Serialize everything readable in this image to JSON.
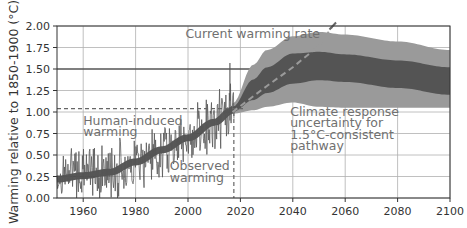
{
  "chart_data": {
    "type": "line",
    "title": "",
    "xlabel": "",
    "ylabel": "Warming relative to 1850-1900 (°C)",
    "xlim": [
      1950,
      2100
    ],
    "ylim": [
      0.0,
      2.0
    ],
    "grid": true,
    "xticks": [
      "1960",
      "1980",
      "2000",
      "2020",
      "2040",
      "2060",
      "2080",
      "2100"
    ],
    "xtick_values": [
      1960,
      1980,
      2000,
      2020,
      2040,
      2060,
      2080,
      2100
    ],
    "yticks": [
      "0.00",
      "0.25",
      "0.50",
      "0.75",
      "1.00",
      "1.25",
      "1.50",
      "1.75",
      "2.00"
    ],
    "ytick_values": [
      0.0,
      0.25,
      0.5,
      0.75,
      1.0,
      1.25,
      1.5,
      1.75,
      2.0
    ],
    "highlight_hline": 1.5,
    "annotations": [
      {
        "text": "Current warming rate",
        "x": 1999,
        "y": 1.86
      },
      {
        "text": "Human-induced",
        "x": 1960,
        "y": 0.85
      },
      {
        "text": "warming",
        "x": 1960,
        "y": 0.72
      },
      {
        "text": "Observed",
        "x": 1993,
        "y": 0.32
      },
      {
        "text": "warming",
        "x": 1993,
        "y": 0.19
      },
      {
        "text": "Climate response",
        "x": 2039,
        "y": 0.95
      },
      {
        "text": "uncertainty for",
        "x": 2039,
        "y": 0.82
      },
      {
        "text": "1.5°C-consistent",
        "x": 2039,
        "y": 0.69
      },
      {
        "text": "pathway",
        "x": 2039,
        "y": 0.56
      }
    ],
    "reference_lines": {
      "human_induced_level_2017": 1.04,
      "present_year": 2017.5
    },
    "series": [
      {
        "name": "Observed warming (monthly, noisy)",
        "color": "#555555",
        "style": "noisy-line",
        "x": [
          1950,
          1955,
          1960,
          1965,
          1970,
          1975,
          1980,
          1985,
          1990,
          1995,
          2000,
          2005,
          2010,
          2015,
          2017
        ],
        "values": [
          0.25,
          0.27,
          0.3,
          0.28,
          0.3,
          0.33,
          0.45,
          0.5,
          0.55,
          0.6,
          0.68,
          0.8,
          0.85,
          0.95,
          1.05
        ]
      },
      {
        "name": "Human-induced warming",
        "color": "#444444",
        "style": "thick-band",
        "x": [
          1950,
          1960,
          1970,
          1980,
          1990,
          2000,
          2010,
          2017
        ],
        "values": [
          0.22,
          0.26,
          0.3,
          0.42,
          0.56,
          0.7,
          0.88,
          1.02
        ]
      },
      {
        "name": "Current warming rate",
        "color": "#9a9a9a",
        "style": "dashed",
        "x": [
          2017,
          2030,
          2040,
          2050,
          2055
        ],
        "values": [
          1.0,
          1.3,
          1.52,
          1.77,
          1.99
        ]
      },
      {
        "name": "Climate response uncertainty (outer)",
        "color": "#9a9a9a",
        "style": "band",
        "x": [
          2017,
          2025,
          2030,
          2040,
          2050,
          2060,
          2080,
          2100
        ],
        "upper": [
          1.1,
          1.55,
          1.72,
          1.88,
          1.93,
          1.9,
          1.82,
          1.72
        ],
        "lower": [
          0.98,
          1.02,
          1.06,
          1.11,
          1.06,
          1.05,
          1.05,
          1.05
        ]
      },
      {
        "name": "Climate response uncertainty (inner)",
        "color": "#545454",
        "style": "band",
        "x": [
          2017,
          2025,
          2030,
          2040,
          2050,
          2060,
          2080,
          2100
        ],
        "upper": [
          1.06,
          1.38,
          1.52,
          1.68,
          1.7,
          1.67,
          1.6,
          1.52
        ],
        "lower": [
          1.0,
          1.14,
          1.22,
          1.33,
          1.37,
          1.35,
          1.28,
          1.2
        ]
      }
    ]
  },
  "colors": {
    "axes": "#333333",
    "grid": "#b0b0b0",
    "hline_1_5": "#555555",
    "band_outer": "#9a9a9a",
    "band_inner": "#545454",
    "observed": "#555555",
    "annotation_text": "#707070"
  }
}
